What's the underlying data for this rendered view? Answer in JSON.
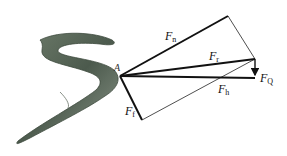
{
  "diagram": {
    "origin_point": "A",
    "forces": [
      {
        "id": "Fn",
        "symbol": "F",
        "sub": "n",
        "style": "thick"
      },
      {
        "id": "Fr",
        "symbol": "F",
        "sub": "r",
        "style": "thick"
      },
      {
        "id": "Fh",
        "symbol": "F",
        "sub": "h",
        "style": "thick"
      },
      {
        "id": "Ff",
        "symbol": "F",
        "sub": "f",
        "style": "thick"
      },
      {
        "id": "FQ",
        "symbol": "F",
        "sub": "Q",
        "style": "arrow"
      }
    ],
    "colors": {
      "line": "#111111",
      "thin_line": "#222222",
      "eel_body": "#5a6a5a",
      "eel_belly": "#b9c2b6"
    }
  }
}
